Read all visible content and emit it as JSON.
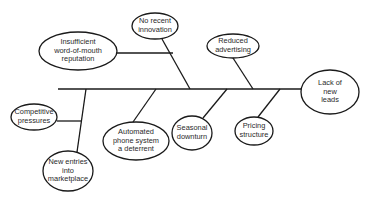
{
  "diagram": {
    "type": "fishbone",
    "colors": {
      "stroke": "#1a1a1a",
      "text": "#2a2a2a",
      "background": "#ffffff"
    },
    "effect": {
      "id": "effect",
      "label": "Lack of new\nleads"
    },
    "causes": [
      {
        "id": "no-recent-innovation",
        "label": "No recent\ninnovation",
        "side": "top"
      },
      {
        "id": "insufficient-word-of-mouth",
        "label": "Insufficient\nword-of-mouth\nreputation",
        "side": "top"
      },
      {
        "id": "reduced-advertising",
        "label": "Reduced\nadvertising",
        "side": "top"
      },
      {
        "id": "competitive-pressures",
        "label": "Competitive\npressures",
        "side": "bottom"
      },
      {
        "id": "new-entries",
        "label": "New entries\ninto\nmarketplace",
        "side": "bottom"
      },
      {
        "id": "automated-phone-system",
        "label": "Automated\nphone system\na deterrent",
        "side": "bottom"
      },
      {
        "id": "seasonal-downturn",
        "label": "Seasonal\ndownturn",
        "side": "bottom"
      },
      {
        "id": "pricing-structure",
        "label": "Pricing\nstructure",
        "side": "bottom"
      }
    ]
  }
}
